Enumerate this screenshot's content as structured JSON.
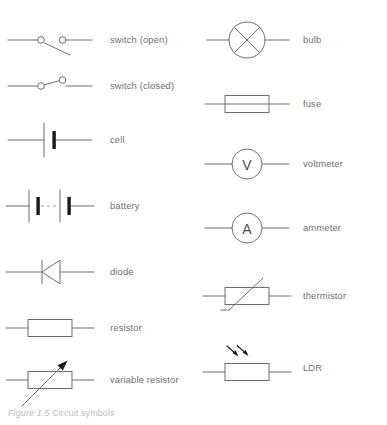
{
  "figure": {
    "caption_label": "Figure 1.5",
    "caption_text": "Circuit symbols",
    "colors": {
      "line": "#6b6d70",
      "terminal_fill": "#ffffff",
      "bar_fill": "#1a1a1a",
      "label_text": "#6d6f72",
      "caption_text": "#b9bbbd",
      "background": "#ffffff"
    }
  },
  "columns": [
    {
      "name": "left-column",
      "items": [
        {
          "label": "switch (open)",
          "icon": "switch-open-symbol"
        },
        {
          "label": "switch (closed)",
          "icon": "switch-closed-symbol"
        },
        {
          "label": "cell",
          "icon": "cell-symbol"
        },
        {
          "label": "battery",
          "icon": "battery-symbol"
        },
        {
          "label": "diode",
          "icon": "diode-symbol"
        },
        {
          "label": "resistor",
          "icon": "resistor-symbol"
        },
        {
          "label": "variable resistor",
          "icon": "variable-resistor-symbol"
        }
      ]
    },
    {
      "name": "right-column",
      "items": [
        {
          "label": "bulb",
          "icon": "bulb-symbol"
        },
        {
          "label": "fuse",
          "icon": "fuse-symbol"
        },
        {
          "label": "voltmeter",
          "icon": "voltmeter-symbol",
          "glyph": "V"
        },
        {
          "label": "ammeter",
          "icon": "ammeter-symbol",
          "glyph": "A"
        },
        {
          "label": "thermistor",
          "icon": "thermistor-symbol"
        },
        {
          "label": "LDR",
          "icon": "ldr-symbol"
        }
      ]
    }
  ]
}
